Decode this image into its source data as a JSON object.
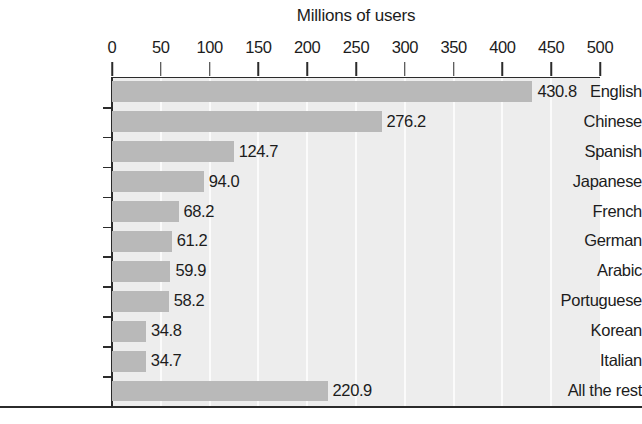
{
  "chart_data": {
    "type": "bar",
    "orientation": "horizontal",
    "title": "Millions of users",
    "xlabel": "",
    "ylabel": "",
    "xlim": [
      0,
      500
    ],
    "xticks": [
      0,
      50,
      100,
      150,
      200,
      250,
      300,
      350,
      400,
      450,
      500
    ],
    "xtick_labels": [
      "0",
      "50",
      "100",
      "150",
      "200",
      "250",
      "300",
      "350",
      "400",
      "450",
      "500"
    ],
    "grid": "vertical",
    "legend": "none",
    "categories": [
      "English",
      "Chinese",
      "Spanish",
      "Japanese",
      "French",
      "German",
      "Arabic",
      "Portuguese",
      "Korean",
      "Italian",
      "All the rest"
    ],
    "values": [
      430.8,
      276.2,
      124.7,
      94.0,
      68.2,
      61.2,
      59.9,
      58.2,
      34.8,
      34.7,
      220.9
    ],
    "value_labels": [
      "430.8",
      "276.2",
      "124.7",
      "94.0",
      "68.2",
      "61.2",
      "59.9",
      "58.2",
      "34.8",
      "34.7",
      "220.9"
    ],
    "bar_color": "#b9b9b9",
    "plot_background": "#ededed",
    "axis_color": "#2b2b2b",
    "text_color": "#1c1c1c"
  }
}
